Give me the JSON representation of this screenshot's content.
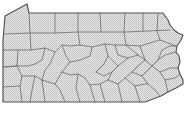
{
  "map": {
    "region": "Pennsylvania",
    "subdivision": "counties",
    "style": {
      "background": "#ffffff",
      "fill_pattern": "crosshatch",
      "fill_light": "#e6e6e6",
      "fill_dark": "#bdbdbd",
      "border_color": "#555555",
      "county_line_color": "#6a6a6a"
    },
    "labels": []
  }
}
